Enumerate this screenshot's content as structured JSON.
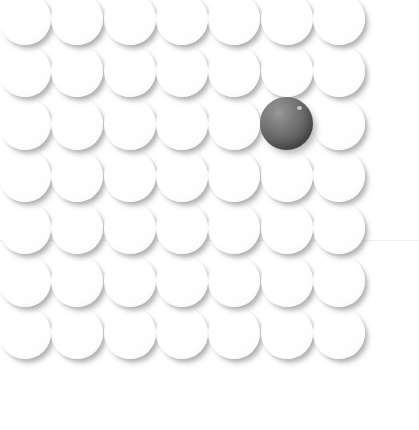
{
  "stimulus": {
    "kind": "visual-search-array",
    "description": "Array of light spheres with one dark sphere singleton",
    "canvas": {
      "width": 419,
      "height": 430
    },
    "background_color": "#ffffff",
    "grid": {
      "columns": 7,
      "rows": 7,
      "sphere_diameter": 52,
      "pitch_x": 52.3,
      "pitch_y": 52.3,
      "first_center_x": 25,
      "first_center_y": 19,
      "cropped_edges": "left-column-and-top-row-clipped"
    },
    "distractor": {
      "label": "light sphere",
      "fill_color": "#ffffff",
      "edge_color": "#efefef",
      "shadow_color": "#8e8e8e",
      "count": 48
    },
    "target": {
      "label": "dark sphere",
      "row": 3,
      "column": 6,
      "center_x": 318,
      "center_y": 150,
      "diameter": 53,
      "highlight_color": "#9a9a9a",
      "mid_color": "#6c6c6c",
      "shade_color": "#3d3d3d",
      "count": 1
    },
    "artifact": {
      "label": "scan seam",
      "y": 240,
      "color": "#ededed"
    }
  }
}
